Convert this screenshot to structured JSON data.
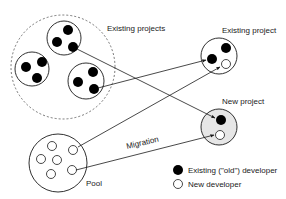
{
  "labels": {
    "existing_projects": "Existing projects",
    "existing_project": "Existing project",
    "new_project": "New project",
    "pool": "Pool",
    "migration": "Migration"
  },
  "legend": {
    "items": [
      {
        "symbol": "filled-circle",
        "label": "Existing (\"old\") developer"
      },
      {
        "symbol": "empty-circle",
        "label": "New developer"
      }
    ]
  },
  "colors": {
    "stroke": "#1a1a1a",
    "developer_old": "#000000",
    "developer_new": "#ffffff",
    "new_project_fill": "#e6e6e6",
    "background": "#ffffff"
  },
  "nodes": {
    "existing_projects_group": {
      "projects": 3,
      "developers_per_project": 3
    },
    "existing_project": {
      "old_developers": 2,
      "new_developers": 1
    },
    "new_project": {
      "old_developers": 1,
      "new_developers": 1
    },
    "pool": {
      "new_developers": 6
    }
  }
}
